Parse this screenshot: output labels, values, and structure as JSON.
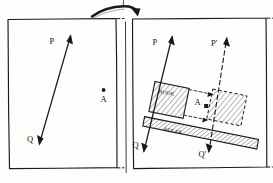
{
  "figure": {
    "background_color": "#fdfdfc",
    "ink_color": "#1a1a1a",
    "width": 273,
    "height": 183
  },
  "top_annotation": {
    "curved_arrow_name": "curved-arrow-right",
    "tick_mark": "|"
  },
  "left_panel": {
    "name": "left-panel",
    "vector": {
      "tail_label": "Q",
      "head_label": "P",
      "style": "solid",
      "arrowheads": "both"
    },
    "point": {
      "label": "A",
      "marker": "dot"
    }
  },
  "right_panel": {
    "name": "right-panel",
    "original_vector": {
      "tail_label": "Q",
      "head_label": "P",
      "style": "solid",
      "arrowheads": "both"
    },
    "translated_vector": {
      "tail_label": "Q'",
      "head_label": "P'",
      "style": "dashed",
      "arrowheads": "both"
    },
    "book": {
      "label": "BOOK",
      "fill": "hatched",
      "outline": "solid"
    },
    "book_translated": {
      "label": "",
      "fill": "hatched",
      "outline": "dashed"
    },
    "ruler": {
      "label": "RULER",
      "fill": "hatched",
      "outline": "solid"
    },
    "point": {
      "label": "A",
      "marker": "square"
    },
    "guide_lines": {
      "style": "dashed",
      "arrowheads": "right"
    }
  }
}
